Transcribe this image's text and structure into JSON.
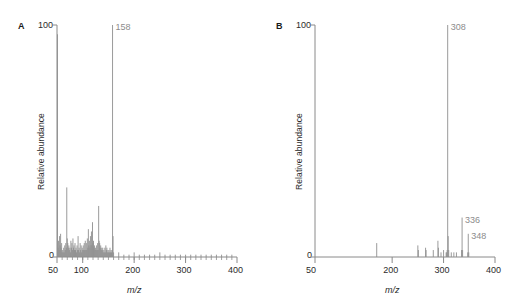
{
  "figure": {
    "panels": [
      {
        "letter": "A",
        "y_axis": {
          "title": "Relative abundance",
          "max_label": "100",
          "min_label": "0",
          "range": [
            0,
            100
          ]
        },
        "x_axis": {
          "title": "m/z",
          "range": [
            50,
            400
          ],
          "major_ticks": [
            50,
            100,
            200,
            300,
            400
          ],
          "tick_labels": [
            "50",
            "100",
            "200",
            "300",
            "400"
          ],
          "minor_tick_step": 10
        },
        "peak_labels": [
          {
            "text": "158",
            "mz": 158,
            "color": "#8c8c8c"
          }
        ]
      },
      {
        "letter": "B",
        "y_axis": {
          "title": "Relative abundance",
          "max_label": "100",
          "min_label": "0",
          "range": [
            0,
            100
          ]
        },
        "x_axis": {
          "title": "m/z",
          "range": [
            50,
            400
          ],
          "major_ticks": [
            50,
            200,
            300,
            400
          ],
          "tick_labels": [
            "50",
            "200",
            "300",
            "400"
          ],
          "minor_tick_step": 0
        },
        "peak_labels": [
          {
            "text": "308",
            "mz": 308,
            "color": "#8c8c8c"
          },
          {
            "text": "336",
            "mz": 336,
            "color": "#8c8c8c"
          },
          {
            "text": "348",
            "mz": 348,
            "color": "#8c8c8c"
          }
        ]
      }
    ]
  },
  "chart_data": [
    {
      "type": "bar",
      "title": "A",
      "xlabel": "m/z",
      "ylabel": "Relative abundance",
      "xlim": [
        50,
        400
      ],
      "ylim": [
        0,
        100
      ],
      "grid": false,
      "legend": "none",
      "annotations": [
        {
          "label": "158",
          "x": 158,
          "y": 100
        }
      ],
      "x": [
        51,
        52,
        53,
        54,
        55,
        56,
        57,
        58,
        59,
        60,
        61,
        62,
        63,
        64,
        65,
        66,
        67,
        68,
        69,
        70,
        71,
        72,
        73,
        74,
        75,
        76,
        77,
        78,
        79,
        80,
        81,
        82,
        83,
        84,
        85,
        86,
        87,
        88,
        89,
        90,
        91,
        92,
        93,
        94,
        95,
        96,
        97,
        98,
        99,
        100,
        101,
        102,
        103,
        104,
        105,
        106,
        107,
        108,
        109,
        110,
        111,
        112,
        113,
        114,
        115,
        116,
        117,
        118,
        119,
        120,
        121,
        122,
        123,
        124,
        125,
        126,
        127,
        128,
        129,
        130,
        131,
        132,
        133,
        134,
        135,
        136,
        137,
        138,
        139,
        140,
        141,
        142,
        143,
        144,
        145,
        146,
        147,
        148,
        149,
        150,
        151,
        152,
        153,
        154,
        155,
        156,
        157,
        158,
        159,
        160,
        170,
        180,
        190,
        200,
        210,
        220,
        230,
        240,
        250,
        260,
        270,
        280,
        290,
        300,
        310,
        320,
        330,
        340,
        350,
        360,
        370,
        380,
        390
      ],
      "values": [
        96,
        4,
        7,
        3,
        9,
        5,
        10,
        4,
        6,
        2,
        3,
        2,
        4,
        2,
        5,
        3,
        6,
        4,
        30,
        8,
        6,
        4,
        5,
        3,
        4,
        2,
        7,
        4,
        6,
        3,
        8,
        4,
        5,
        3,
        6,
        3,
        4,
        2,
        5,
        3,
        9,
        3,
        4,
        2,
        6,
        3,
        5,
        2,
        4,
        3,
        5,
        3,
        6,
        3,
        7,
        3,
        6,
        3,
        8,
        4,
        12,
        5,
        7,
        4,
        9,
        5,
        11,
        5,
        15,
        6,
        7,
        4,
        5,
        3,
        4,
        3,
        5,
        3,
        6,
        3,
        22,
        7,
        6,
        4,
        5,
        3,
        4,
        3,
        4,
        2,
        3,
        2,
        4,
        2,
        5,
        3,
        4,
        2,
        3,
        2,
        3,
        2,
        4,
        2,
        3,
        2,
        3,
        100,
        9,
        2,
        2,
        1,
        1,
        2,
        1,
        1,
        1,
        1,
        2,
        1,
        1,
        1,
        1,
        1,
        1,
        1,
        1,
        1,
        1,
        1,
        1,
        1,
        1
      ]
    },
    {
      "type": "bar",
      "title": "B",
      "xlabel": "m/z",
      "ylabel": "Relative abundance",
      "xlim": [
        50,
        400
      ],
      "ylim": [
        0,
        100
      ],
      "grid": false,
      "legend": "none",
      "annotations": [
        {
          "label": "308",
          "x": 308,
          "y": 100
        },
        {
          "label": "336",
          "x": 336,
          "y": 17
        },
        {
          "label": "348",
          "x": 348,
          "y": 10
        }
      ],
      "x": [
        170,
        250,
        251,
        265,
        266,
        280,
        289,
        290,
        295,
        300,
        305,
        306,
        307,
        308,
        309,
        310,
        315,
        320,
        325,
        335,
        336,
        337,
        347,
        348,
        349
      ],
      "values": [
        6,
        5,
        3,
        4,
        3,
        3,
        7,
        4,
        2,
        3,
        2,
        2,
        3,
        100,
        9,
        3,
        2,
        2,
        2,
        3,
        17,
        3,
        2,
        10,
        2
      ]
    }
  ]
}
